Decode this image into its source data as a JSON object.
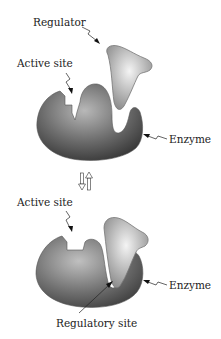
{
  "diagram": {
    "type": "allosteric-regulation",
    "top_panel": {
      "labels": {
        "regulator": "Regulator",
        "active_site": "Active site",
        "enzyme": "Enzyme"
      },
      "state": "regulator unbound, active site open"
    },
    "arrow": {
      "symbol": "double-arrow-up-down",
      "meaning": "reversible"
    },
    "bottom_panel": {
      "labels": {
        "active_site": "Active site",
        "enzyme": "Enzyme",
        "regulatory_site": "Regulatory site"
      },
      "state": "regulator bound, active site altered"
    },
    "colors": {
      "enzyme_dark": "#3a3a3a",
      "enzyme_light": "#9a9a9a",
      "regulator_light": "#e8e8e8",
      "regulator_dark": "#8a8a8a",
      "text": "#222222"
    }
  }
}
